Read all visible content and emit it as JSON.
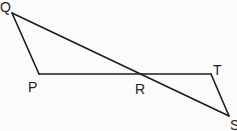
{
  "diagram": {
    "type": "geometry",
    "stroke_color": "#1c1c1c",
    "points": {
      "Q": {
        "label": "Q",
        "x": 12,
        "y": 13,
        "label_x": 0,
        "label_y": 12
      },
      "P": {
        "label": "P",
        "x": 39,
        "y": 74,
        "label_x": 28,
        "label_y": 92
      },
      "R": {
        "label": "R",
        "x": 138,
        "y": 74,
        "label_x": 135,
        "label_y": 94
      },
      "T": {
        "label": "T",
        "x": 211,
        "y": 74,
        "label_x": 213,
        "label_y": 75
      },
      "S": {
        "label": "S",
        "x": 229,
        "y": 116,
        "label_x": 230,
        "label_y": 130
      }
    },
    "segments": [
      {
        "from": "Q",
        "to": "P"
      },
      {
        "from": "P",
        "to": "T"
      },
      {
        "from": "Q",
        "to": "S"
      },
      {
        "from": "T",
        "to": "S"
      }
    ]
  }
}
